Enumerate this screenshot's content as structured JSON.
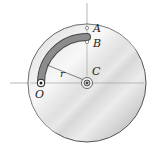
{
  "diagram": {
    "labels": {
      "A": "A",
      "B": "B",
      "C": "C",
      "O": "O",
      "r": "r"
    },
    "colors": {
      "disc_rim": "#555555",
      "disc_light": "#f2f2f2",
      "disc_mid": "#c8c8c8",
      "disc_dark": "#9a9a9a",
      "slot_fill": "#8c8c8c",
      "slot_edge": "#444444",
      "axis_line": "#888888"
    }
  }
}
